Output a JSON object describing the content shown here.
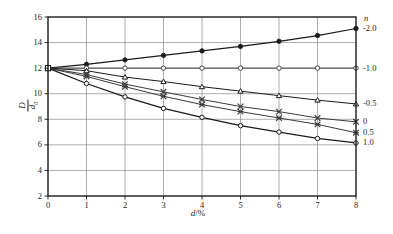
{
  "chart_data": {
    "type": "line",
    "title": "",
    "subtitle": "",
    "xlabel": "d/%",
    "ylabel": "D/d0",
    "xlabel_parts": {
      "italic": "d",
      "rest": "/%"
    },
    "ylabel_parts": {
      "numerator": "D",
      "denominator": "d",
      "denominator_sub": "0"
    },
    "right_axis_label": "n",
    "x": [
      0,
      1,
      2,
      3,
      4,
      5,
      6,
      7,
      8
    ],
    "xlim": [
      0,
      8
    ],
    "ylim": [
      2,
      16
    ],
    "xticks": [
      "0",
      "1",
      "2",
      "3",
      "4",
      "5",
      "6",
      "7",
      "8"
    ],
    "yticks": [
      "2",
      "4",
      "6",
      "8",
      "10",
      "12",
      "14",
      "16"
    ],
    "grid": true,
    "legend_position": "right-axis-end-labels",
    "series": [
      {
        "name": "-2.0",
        "marker": "filled-circle",
        "color": "#1a1a1a",
        "end_label": "-2.0",
        "values": [
          12.0,
          12.3,
          12.65,
          13.0,
          13.35,
          13.7,
          14.1,
          14.55,
          15.1
        ]
      },
      {
        "name": "-1.0",
        "marker": "open-circle",
        "color": "#4a4a4a",
        "end_label": "-1.0",
        "values": [
          12.0,
          12.0,
          12.0,
          12.0,
          12.0,
          12.0,
          12.0,
          12.0,
          12.0
        ]
      },
      {
        "name": "-0.5",
        "marker": "triangle",
        "color": "#1a1a1a",
        "end_label": "-0.5",
        "values": [
          12.0,
          11.8,
          11.3,
          10.95,
          10.55,
          10.2,
          9.85,
          9.5,
          9.2
        ]
      },
      {
        "name": "0",
        "marker": "cross-x",
        "color": "#3a3a3a",
        "end_label": "0",
        "values": [
          12.0,
          11.5,
          10.75,
          10.15,
          9.55,
          9.0,
          8.6,
          8.1,
          7.8
        ]
      },
      {
        "name": "0.5",
        "marker": "asterisk",
        "color": "#3a3a3a",
        "end_label": "0.5",
        "values": [
          12.0,
          11.35,
          10.55,
          9.8,
          9.15,
          8.6,
          8.1,
          7.6,
          6.95
        ]
      },
      {
        "name": "1.0",
        "marker": "open-circle",
        "color": "#1a1a1a",
        "end_label": "1.0",
        "values": [
          12.0,
          10.8,
          9.75,
          8.85,
          8.15,
          7.5,
          7.0,
          6.5,
          6.15
        ]
      }
    ]
  }
}
